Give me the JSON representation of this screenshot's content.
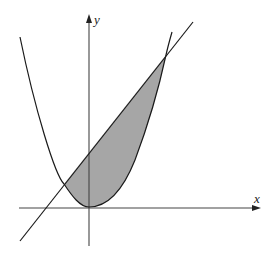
{
  "figure": {
    "x_axis_label": "x",
    "y_axis_label": "y",
    "curves": [
      {
        "name": "parabola",
        "equation_shape": "y = x^2 (upward opening, vertex at origin)"
      },
      {
        "name": "line",
        "equation_shape": "straight line with positive slope and positive y-intercept"
      }
    ],
    "shaded_region": "area bounded between the line (above) and the parabola (below), between their two intersection points",
    "colors": {
      "stroke": "#1a1a1a",
      "fill": "#a6a6a6",
      "axis": "#333333",
      "background": "#ffffff"
    }
  }
}
